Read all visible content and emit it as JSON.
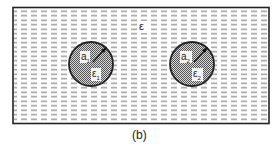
{
  "figure": {
    "caption": "(b)",
    "medium_label": "ε",
    "colors": {
      "stroke": "#222222",
      "dash": "#9a9a9a",
      "sphere_fill": "#8c8c8c",
      "background": "#ffffff"
    },
    "spheres": [
      {
        "radius_label": "a",
        "radius_sub": "1",
        "permittivity_label": "ε",
        "permittivity_sub": "1"
      },
      {
        "radius_label": "a",
        "radius_sub": "2",
        "permittivity_label": "ε",
        "permittivity_sub": "2"
      }
    ]
  }
}
